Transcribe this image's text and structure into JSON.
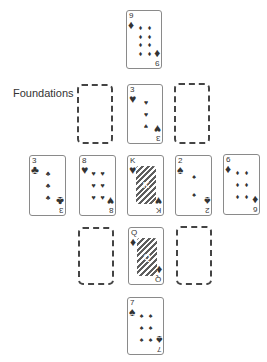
{
  "labels": {
    "foundations": "Foundations"
  },
  "colors": {
    "ink": "#2e2e2e",
    "card_border": "#8a8a8a",
    "empty_border": "#444444",
    "background": "#ffffff"
  },
  "suit_glyphs": {
    "diamonds": "♦",
    "hearts": "♥",
    "clubs": "♣",
    "spades": "♠"
  },
  "cards": {
    "top": {
      "rank": "9",
      "suit": "diamonds",
      "glyph": "♦",
      "pips": "♦♦♦♦♦♦♦♦♦"
    },
    "foundation_mid": {
      "rank": "3",
      "suit": "hearts",
      "glyph": "♥",
      "pips": "♥♥♥"
    },
    "row_1": {
      "rank": "3",
      "suit": "clubs",
      "glyph": "♣",
      "pips": "♣♣♣"
    },
    "row_2": {
      "rank": "8",
      "suit": "hearts",
      "glyph": "♥",
      "pips": "♥♥♥♥♥♥♥♥"
    },
    "row_3": {
      "rank": "K",
      "suit": "hearts",
      "glyph": "♥",
      "face": "K"
    },
    "row_4": {
      "rank": "2",
      "suit": "spades",
      "glyph": "♠",
      "pips": "♠♠"
    },
    "row_5": {
      "rank": "6",
      "suit": "diamonds",
      "glyph": "♦",
      "pips": "♦♦♦♦♦♦"
    },
    "lower_mid": {
      "rank": "Q",
      "suit": "diamonds",
      "glyph": "♦",
      "face": "Q"
    },
    "bottom": {
      "rank": "7",
      "suit": "spades",
      "glyph": "♠",
      "pips": "♠♠♠♠♠♠♠"
    }
  },
  "empty_slots": [
    "foundation_left",
    "foundation_right",
    "lower_left",
    "lower_right"
  ]
}
